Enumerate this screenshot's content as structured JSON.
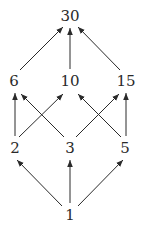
{
  "diagram": {
    "type": "hasse-diagram",
    "colors": {
      "ink": "#2a2a2a",
      "background": "#ffffff"
    },
    "nodes": [
      {
        "id": "n30",
        "label": "30",
        "x": 70,
        "y": 16
      },
      {
        "id": "n6",
        "label": "6",
        "x": 14,
        "y": 81
      },
      {
        "id": "n10",
        "label": "10",
        "x": 70,
        "y": 81
      },
      {
        "id": "n15",
        "label": "15",
        "x": 126,
        "y": 81
      },
      {
        "id": "n2",
        "label": "2",
        "x": 15,
        "y": 148
      },
      {
        "id": "n3",
        "label": "3",
        "x": 70,
        "y": 148
      },
      {
        "id": "n5",
        "label": "5",
        "x": 125,
        "y": 148
      },
      {
        "id": "n1",
        "label": "1",
        "x": 70,
        "y": 215
      }
    ],
    "edges": [
      {
        "from": "1",
        "to": "2"
      },
      {
        "from": "1",
        "to": "3"
      },
      {
        "from": "1",
        "to": "5"
      },
      {
        "from": "2",
        "to": "6"
      },
      {
        "from": "2",
        "to": "10"
      },
      {
        "from": "3",
        "to": "6"
      },
      {
        "from": "3",
        "to": "15"
      },
      {
        "from": "5",
        "to": "10"
      },
      {
        "from": "5",
        "to": "15"
      },
      {
        "from": "6",
        "to": "30"
      },
      {
        "from": "10",
        "to": "30"
      },
      {
        "from": "15",
        "to": "30"
      }
    ]
  }
}
